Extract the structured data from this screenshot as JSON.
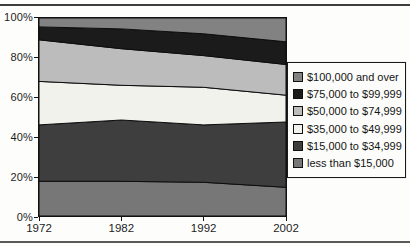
{
  "chart_data": {
    "type": "area",
    "stacked": true,
    "normalized_percent": true,
    "title": "",
    "xlabel": "",
    "ylabel": "",
    "x": [
      1972,
      1982,
      1992,
      2002
    ],
    "x_tick_labels": [
      "1972",
      "1982",
      "1992",
      "2002"
    ],
    "y_tick_labels": [
      "100%",
      "80%",
      "60%",
      "40%",
      "20%",
      "0%"
    ],
    "y_tick_values": [
      100,
      80,
      60,
      40,
      20,
      0
    ],
    "ylim": [
      0,
      100
    ],
    "grid": false,
    "legend_position": "right",
    "series_bottom_to_top": [
      {
        "name": "less than $15,000",
        "color": "#777777",
        "values": [
          17.5,
          17.5,
          17.0,
          14.5
        ]
      },
      {
        "name": "$15,000 to $34,999",
        "color": "#3e3e3e",
        "values": [
          28.5,
          31.0,
          29.0,
          33.0
        ]
      },
      {
        "name": "$35,000 to $49,999",
        "color": "#f2f2ed",
        "values": [
          22.0,
          17.5,
          19.0,
          13.5
        ]
      },
      {
        "name": "$50,000 to $74,999",
        "color": "#bcbcbc",
        "values": [
          21.0,
          18.5,
          16.0,
          15.5
        ]
      },
      {
        "name": "$75,000 to $99,999",
        "color": "#1b1b1b",
        "values": [
          6.5,
          10.0,
          11.0,
          11.5
        ]
      },
      {
        "name": "$100,000 and over",
        "color": "#828282",
        "values": [
          4.5,
          5.5,
          8.0,
          12.0
        ]
      }
    ],
    "legend_entries_top_to_bottom": [
      "$100,000 and over",
      "$75,000 to $99,999",
      "$50,000 to $74,999",
      "$35,000 to $49,999",
      "$15,000 to $34,999",
      "less than $15,000"
    ],
    "outline_color": "#0d0d0d"
  },
  "layout_text": {}
}
